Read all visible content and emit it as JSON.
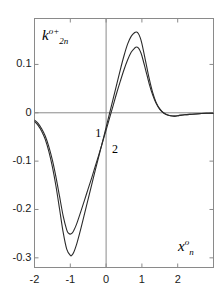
{
  "chart_data": {
    "type": "line",
    "title": "",
    "xlabel": "x_n^o",
    "ylabel": "k_2n^{o+}",
    "xlim": [
      -2.0,
      3.0
    ],
    "ylim": [
      -0.32,
      0.195
    ],
    "grid": false,
    "legend_position": "inline-annotations",
    "axis_lines": {
      "horizontal_zero": 0,
      "vertical_zero": 0
    },
    "xticks": [
      -2,
      -1,
      0,
      1,
      2
    ],
    "xticklabels": [
      "-2",
      "-1",
      "0",
      "1",
      "2"
    ],
    "yticks": [
      0.1,
      0,
      -0.1,
      -0.2,
      -0.3
    ],
    "yticklabels": [
      "0.1",
      "0",
      "-0.1",
      "-0.2",
      "-0.3"
    ],
    "annotations": [
      {
        "text": "1",
        "x": -0.22,
        "y": -0.043
      },
      {
        "text": "2",
        "x": 0.25,
        "y": -0.077
      }
    ],
    "series": [
      {
        "name": "1",
        "color": "#2b2b2b",
        "x": [
          -2.0,
          -1.9,
          -1.8,
          -1.7,
          -1.6,
          -1.5,
          -1.4,
          -1.3,
          -1.2,
          -1.1,
          -1.0,
          -0.95,
          -0.9,
          -0.85,
          -0.8,
          -0.7,
          -0.6,
          -0.5,
          -0.4,
          -0.3,
          -0.2,
          -0.1,
          0.0,
          0.1,
          0.2,
          0.3,
          0.4,
          0.5,
          0.6,
          0.7,
          0.8,
          0.85,
          0.9,
          0.95,
          1.0,
          1.1,
          1.2,
          1.3,
          1.4,
          1.5,
          1.6,
          1.7,
          1.8,
          1.9,
          2.0,
          2.2,
          2.4,
          2.6,
          2.8,
          3.0
        ],
        "y": [
          -0.018,
          -0.026,
          -0.038,
          -0.055,
          -0.08,
          -0.112,
          -0.152,
          -0.199,
          -0.247,
          -0.282,
          -0.295,
          -0.294,
          -0.288,
          -0.278,
          -0.266,
          -0.238,
          -0.208,
          -0.178,
          -0.148,
          -0.118,
          -0.089,
          -0.06,
          -0.03,
          0.0,
          0.03,
          0.06,
          0.09,
          0.118,
          0.142,
          0.158,
          0.166,
          0.167,
          0.164,
          0.156,
          0.143,
          0.108,
          0.072,
          0.042,
          0.021,
          0.008,
          0.0,
          -0.004,
          -0.006,
          -0.007,
          -0.006,
          -0.004,
          -0.003,
          -0.002,
          -0.001,
          -0.001
        ]
      },
      {
        "name": "2",
        "color": "#2b2b2b",
        "x": [
          -2.0,
          -1.9,
          -1.8,
          -1.7,
          -1.6,
          -1.5,
          -1.4,
          -1.3,
          -1.2,
          -1.1,
          -1.05,
          -1.0,
          -0.95,
          -0.9,
          -0.85,
          -0.8,
          -0.7,
          -0.6,
          -0.5,
          -0.4,
          -0.3,
          -0.2,
          -0.1,
          0.0,
          0.1,
          0.2,
          0.3,
          0.4,
          0.5,
          0.6,
          0.7,
          0.8,
          0.85,
          0.9,
          0.95,
          1.0,
          1.1,
          1.2,
          1.3,
          1.4,
          1.5,
          1.6,
          1.7,
          1.8,
          1.9,
          2.0,
          2.2,
          2.4,
          2.6,
          2.8,
          3.0
        ],
        "y": [
          -0.015,
          -0.022,
          -0.033,
          -0.048,
          -0.07,
          -0.098,
          -0.133,
          -0.173,
          -0.213,
          -0.242,
          -0.249,
          -0.251,
          -0.249,
          -0.243,
          -0.235,
          -0.225,
          -0.203,
          -0.18,
          -0.157,
          -0.134,
          -0.11,
          -0.086,
          -0.061,
          -0.036,
          -0.01,
          0.016,
          0.042,
          0.066,
          0.089,
          0.109,
          0.125,
          0.134,
          0.136,
          0.134,
          0.128,
          0.118,
          0.09,
          0.061,
          0.037,
          0.019,
          0.007,
          0.0,
          -0.004,
          -0.006,
          -0.007,
          -0.006,
          -0.004,
          -0.003,
          -0.002,
          -0.001,
          -0.001
        ]
      }
    ]
  },
  "axis_titles": {
    "y": {
      "base": "k",
      "sup": "o+",
      "sub": "2n"
    },
    "x": {
      "base": "x",
      "sup": "o",
      "sub": "n"
    }
  },
  "colors": {
    "frame": "#8a8a8a",
    "zero_line": "#8a8a8a",
    "curve": "#2b2b2b",
    "text": "#1a1a1a",
    "background": "#ffffff"
  }
}
